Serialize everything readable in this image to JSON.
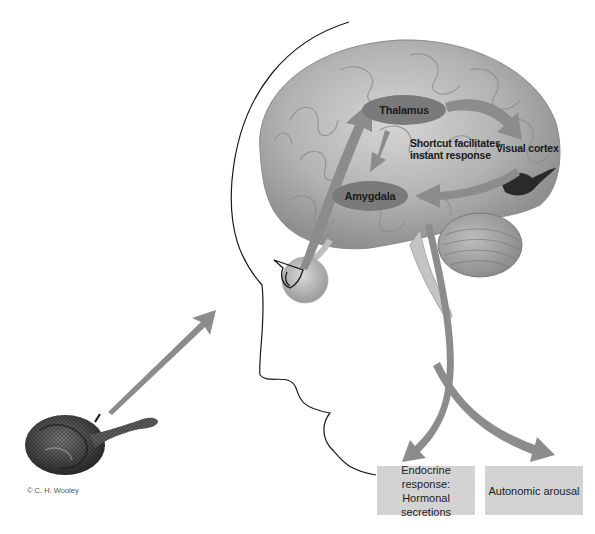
{
  "diagram": {
    "nodes": {
      "thalamus": "Thalamus",
      "amygdala": "Amygdala",
      "visual_cortex": "Visual cortex",
      "shortcut_line1": "Shortcut facilitates",
      "shortcut_line2": "instant response"
    },
    "outputs": {
      "endocrine_line1": "Endocrine response:",
      "endocrine_line2": "Hormonal secretions",
      "autonomic": "Autonomic arousal"
    },
    "stimulus": "snake",
    "credit": "© C. H. Wooley",
    "colors": {
      "arrow": "#8c8c8c",
      "oval": "#7a7a7a",
      "box": "#d3d3d3",
      "brain": "#b5b5b5",
      "outline": "#1a1a1a"
    }
  }
}
